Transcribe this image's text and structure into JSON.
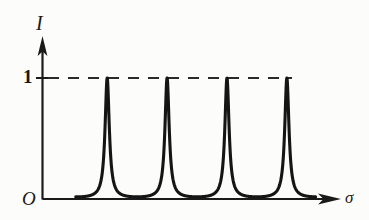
{
  "figure": {
    "kind": "line-plot",
    "background_color": "#fcfcfb",
    "ink_color": "#1a1a1a"
  },
  "axes": {
    "y_axis_label": "I",
    "x_axis_label": "σ",
    "origin_label": "O",
    "y_tick_labels": [
      "1"
    ],
    "x_tick_labels": [],
    "y_arrow": true,
    "x_arrow": true,
    "reference_line": {
      "style": "dashed",
      "value_label": "1"
    }
  },
  "chart_data": {
    "type": "line",
    "title": "",
    "subtitle": "",
    "xlabel": "σ",
    "ylabel": "I",
    "grid": false,
    "legend": null,
    "xlim": [
      0,
      4.75
    ],
    "ylim": [
      0,
      1.12
    ],
    "y_ticks": [
      0
    ],
    "y_tick_labels": [
      "1"
    ],
    "y_tick_values": [
      1
    ],
    "x_ticks": [],
    "annotations": [
      {
        "text": "1",
        "x": 0,
        "y": 1,
        "role": "y-tick"
      },
      {
        "text": "O",
        "x": 0,
        "y": 0,
        "role": "origin"
      },
      {
        "text": "I",
        "x": 0,
        "y": 1.12,
        "role": "y-axis-label"
      },
      {
        "text": "σ",
        "x": 4.75,
        "y": 0,
        "role": "x-axis-label"
      }
    ],
    "reference_lines": [
      {
        "orientation": "horizontal",
        "y": 1,
        "style": "dashed",
        "x_start": 0,
        "x_end": 4.1
      }
    ],
    "series": [
      {
        "name": "Airy transmission function",
        "style": "solid",
        "width": 3,
        "color": "#1a1a1a",
        "formula": "I = 1 / (1 + F*sin^2(pi*sigma))",
        "finesse_F": 55,
        "period": 1.0,
        "x_start": 0.555,
        "x_end": 4.56,
        "minima_x": [
          0.58,
          1.58,
          2.58,
          3.58,
          4.55
        ],
        "maxima_x": [
          1.08,
          2.08,
          3.08,
          4.08
        ],
        "maxima_y": [
          1,
          1,
          1,
          1
        ],
        "minima_y": [
          0,
          0,
          0,
          0,
          0
        ],
        "x": [
          0.555,
          0.6,
          0.7,
          0.8,
          0.85,
          0.9,
          0.94,
          0.97,
          1.0,
          1.04,
          1.08,
          1.12,
          1.16,
          1.19,
          1.22,
          1.26,
          1.3,
          1.36,
          1.46,
          1.58,
          1.7,
          1.8,
          1.85,
          1.9,
          1.94,
          1.97,
          2.0,
          2.04,
          2.08,
          2.12,
          2.16,
          2.19,
          2.22,
          2.26,
          2.3,
          2.36,
          2.46,
          2.58,
          2.7,
          2.8,
          2.85,
          2.9,
          2.94,
          2.97,
          3.0,
          3.04,
          3.08,
          3.12,
          3.16,
          3.19,
          3.22,
          3.26,
          3.3,
          3.36,
          3.46,
          3.58,
          3.7,
          3.8,
          3.85,
          3.9,
          3.94,
          3.97,
          4.0,
          4.04,
          4.08,
          4.12,
          4.16,
          4.19,
          4.22,
          4.26,
          4.3,
          4.36,
          4.46,
          4.55
        ],
        "y": [
          0.33,
          0.09,
          0.01,
          0.005,
          0.02,
          0.07,
          0.17,
          0.33,
          0.62,
          0.92,
          1.0,
          0.92,
          0.62,
          0.4,
          0.22,
          0.09,
          0.03,
          0.01,
          0.003,
          0.0,
          0.003,
          0.01,
          0.02,
          0.07,
          0.17,
          0.33,
          0.62,
          0.92,
          1.0,
          0.92,
          0.62,
          0.4,
          0.22,
          0.09,
          0.03,
          0.01,
          0.003,
          0.0,
          0.003,
          0.01,
          0.02,
          0.07,
          0.17,
          0.33,
          0.62,
          0.92,
          1.0,
          0.92,
          0.62,
          0.4,
          0.22,
          0.09,
          0.03,
          0.01,
          0.003,
          0.0,
          0.003,
          0.01,
          0.02,
          0.07,
          0.17,
          0.33,
          0.62,
          0.92,
          1.0,
          0.92,
          0.62,
          0.4,
          0.22,
          0.09,
          0.03,
          0.01,
          0.02,
          0.22
        ]
      }
    ]
  }
}
